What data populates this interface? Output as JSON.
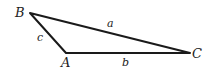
{
  "diagram": {
    "type": "triangle",
    "vertices": {
      "A": {
        "label": "A",
        "x": 66,
        "y": 53
      },
      "B": {
        "label": "B",
        "x": 30,
        "y": 13
      },
      "C": {
        "label": "C",
        "x": 190,
        "y": 53
      }
    },
    "sides": {
      "a": {
        "label": "a",
        "from": "B",
        "to": "C"
      },
      "b": {
        "label": "b",
        "from": "A",
        "to": "C"
      },
      "c": {
        "label": "c",
        "from": "B",
        "to": "A"
      }
    },
    "colors": {
      "stroke": "#1a1a1a",
      "text": "#222222",
      "background": "#ffffff"
    }
  }
}
